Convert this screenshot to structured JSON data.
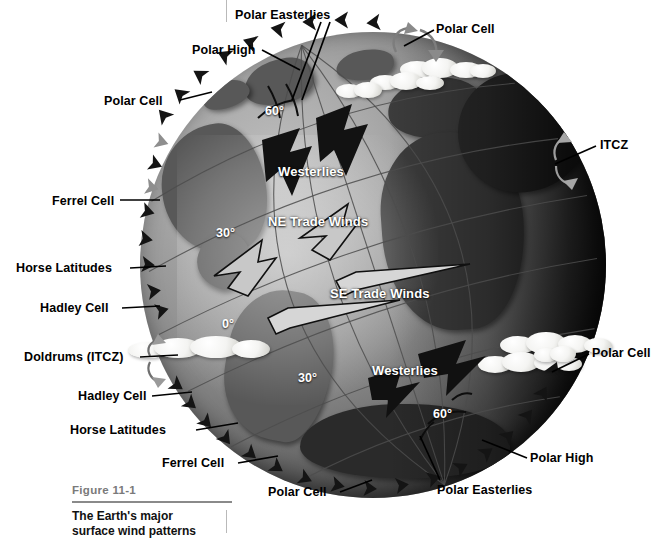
{
  "figure": {
    "number": "Figure 11-1",
    "caption_line1": "The Earth's major",
    "caption_line2": "surface wind patterns",
    "background_color": "#ffffff",
    "label_color": "#000000",
    "onglobe_label_color": "#ffffff",
    "rule_color": "#8a8a8a"
  },
  "labels": {
    "external": [
      {
        "id": "polar-easterlies-top",
        "text": "Polar Easterlies",
        "x": 235,
        "y": 8,
        "align": "left"
      },
      {
        "id": "polar-cell-top-right",
        "text": "Polar Cell",
        "x": 436,
        "y": 22,
        "align": "left"
      },
      {
        "id": "polar-high-top-left",
        "text": "Polar High",
        "x": 192,
        "y": 43,
        "align": "left"
      },
      {
        "id": "polar-cell-top-left",
        "text": "Polar Cell",
        "x": 104,
        "y": 94,
        "align": "left"
      },
      {
        "id": "itcz-right",
        "text": "ITCZ",
        "x": 600,
        "y": 145,
        "align": "left"
      },
      {
        "id": "ferrel-cell-left",
        "text": "Ferrel Cell",
        "x": 52,
        "y": 194,
        "align": "left"
      },
      {
        "id": "horse-latitudes-north",
        "text": "Horse Latitudes",
        "x": 16,
        "y": 263,
        "align": "left"
      },
      {
        "id": "hadley-cell-north",
        "text": "Hadley Cell",
        "x": 40,
        "y": 301,
        "align": "left"
      },
      {
        "id": "doldrums-itcz",
        "text": "Doldrums (ITCZ)",
        "x": 24,
        "y": 352,
        "align": "left"
      },
      {
        "id": "hadley-cell-south",
        "text": "Hadley Cell",
        "x": 78,
        "y": 390,
        "align": "left"
      },
      {
        "id": "polar-cell-right",
        "text": "Polar Cell",
        "x": 592,
        "y": 352,
        "align": "left"
      },
      {
        "id": "horse-latitudes-south",
        "text": "Horse Latitudes",
        "x": 70,
        "y": 425,
        "align": "left"
      },
      {
        "id": "ferrel-cell-south",
        "text": "Ferrel Cell",
        "x": 162,
        "y": 457,
        "align": "left"
      },
      {
        "id": "polar-high-bottom",
        "text": "Polar High",
        "x": 530,
        "y": 456,
        "align": "left"
      },
      {
        "id": "polar-cell-bottom",
        "text": "Polar Cell",
        "x": 268,
        "y": 489,
        "align": "left"
      },
      {
        "id": "polar-easterlies-bottom",
        "text": "Polar Easterlies",
        "x": 437,
        "y": 487,
        "align": "left"
      }
    ],
    "on_globe": [
      {
        "id": "westerlies-north",
        "text": "Westerlies",
        "x": 278,
        "y": 165
      },
      {
        "id": "ne-trade-winds",
        "text": "NE Trade Winds",
        "x": 268,
        "y": 216
      },
      {
        "id": "se-trade-winds",
        "text": "SE Trade Winds",
        "x": 330,
        "y": 287
      },
      {
        "id": "westerlies-south",
        "text": "Westerlies",
        "x": 372,
        "y": 364
      }
    ],
    "latitudes": [
      {
        "id": "lat-60-north",
        "text": "60°",
        "x": 265,
        "y": 103
      },
      {
        "id": "lat-30-north",
        "text": "30°",
        "x": 216,
        "y": 226
      },
      {
        "id": "lat-0-equator",
        "text": "0°",
        "x": 222,
        "y": 318
      },
      {
        "id": "lat-30-south",
        "text": "30°",
        "x": 298,
        "y": 371
      },
      {
        "id": "lat-60-south",
        "text": "60°",
        "x": 433,
        "y": 408
      }
    ]
  },
  "globe": {
    "center_x": 373,
    "center_y": 265,
    "radius": 233,
    "description": "Shaded relief globe centered over the Atlantic Ocean showing North/South America on the left limb, Europe and Africa centre-right, with the night terminator on the far right limb."
  },
  "wind_cells": [
    "Polar Cell",
    "Ferrel Cell",
    "Hadley Cell",
    "Hadley Cell",
    "Ferrel Cell",
    "Polar Cell"
  ],
  "wind_belts": [
    "Polar Easterlies",
    "Westerlies",
    "NE Trade Winds",
    "SE Trade Winds",
    "Westerlies",
    "Polar Easterlies"
  ],
  "pressure_zones": [
    "Polar High",
    "Horse Latitudes",
    "Doldrums (ITCZ)",
    "Horse Latitudes",
    "Polar High"
  ]
}
